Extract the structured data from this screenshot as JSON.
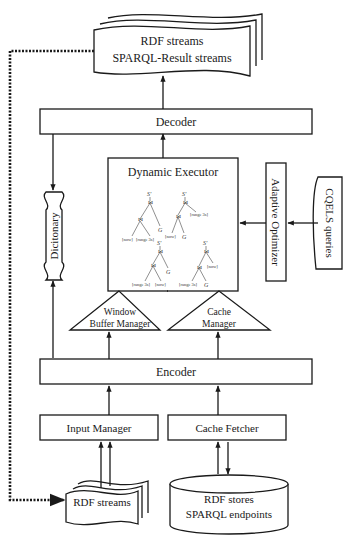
{
  "diagram": {
    "nodes": {
      "output_streams": {
        "line1": "RDF streams",
        "line2": "SPARQL-Result streams",
        "shape": "stacked-document"
      },
      "decoder": {
        "label": "Decoder",
        "shape": "rectangle"
      },
      "dictionary": {
        "label": "Dicitonary",
        "shape": "vertical-wavy-tape"
      },
      "dynamic_executor": {
        "label": "Dynamic Executor",
        "shape": "rectangle",
        "query_plans": [
          {
            "root": "S'",
            "join": "⋈",
            "leaves": [
              "[now]",
              "[range 3s]",
              "G"
            ]
          },
          {
            "root": "S'",
            "join": "⋈",
            "leaves": [
              "[now]",
              "G",
              "[range 3s]"
            ]
          },
          {
            "root": "S'",
            "join": "⋈",
            "leaves": [
              "[range 3s]",
              "[now]",
              "G"
            ]
          },
          {
            "root": "S'",
            "join": "⋈",
            "leaves": [
              "[range 3s]",
              "G",
              "[now]"
            ]
          }
        ]
      },
      "adaptive_optimizer": {
        "label": "Adaptive Optimizer",
        "shape": "vertical-rectangle"
      },
      "cqels_queries": {
        "label": "CQELS queries",
        "shape": "vertical-wavy-tape"
      },
      "window_buffer_manager": {
        "line1": "Window",
        "line2": "Buffer Manager",
        "shape": "triangle"
      },
      "cache_manager": {
        "line1": "Cache",
        "line2": "Manager",
        "shape": "triangle"
      },
      "encoder": {
        "label": "Encoder",
        "shape": "rectangle"
      },
      "input_manager": {
        "label": "Input Manager",
        "shape": "rectangle"
      },
      "cache_fetcher": {
        "label": "Cache Fetcher",
        "shape": "rectangle"
      },
      "input_streams": {
        "label": "RDF streams",
        "shape": "stacked-document"
      },
      "rdf_stores": {
        "line1": "RDF stores",
        "line2": "SPARQL endpoints",
        "shape": "cylinder"
      }
    },
    "edges": [
      {
        "from": "decoder",
        "to": "output_streams",
        "style": "solid-arrow"
      },
      {
        "from": "dynamic_executor",
        "to": "decoder",
        "style": "solid-arrow"
      },
      {
        "from": "decoder",
        "to": "dictionary",
        "style": "solid-arrow"
      },
      {
        "from": "encoder",
        "to": "dictionary",
        "style": "solid-arrow"
      },
      {
        "from": "cqels_queries",
        "to": "adaptive_optimizer",
        "style": "solid-arrow"
      },
      {
        "from": "adaptive_optimizer",
        "to": "dynamic_executor",
        "style": "solid-arrow"
      },
      {
        "from": "window_buffer_manager",
        "to": "dynamic_executor",
        "style": "line"
      },
      {
        "from": "cache_manager",
        "to": "dynamic_executor",
        "style": "line"
      },
      {
        "from": "encoder",
        "to": "window_buffer_manager",
        "style": "solid-arrow"
      },
      {
        "from": "encoder",
        "to": "cache_manager",
        "style": "solid-arrow"
      },
      {
        "from": "input_manager",
        "to": "encoder",
        "style": "solid-arrow"
      },
      {
        "from": "cache_fetcher",
        "to": "encoder",
        "style": "solid-arrow"
      },
      {
        "from": "input_streams",
        "to": "input_manager",
        "style": "double-solid-arrow"
      },
      {
        "from": "rdf_stores",
        "to": "cache_fetcher",
        "style": "solid-arrow"
      },
      {
        "from": "cache_fetcher",
        "to": "rdf_stores",
        "style": "solid-arrow"
      },
      {
        "from": "output_streams",
        "to": "input_streams",
        "style": "dotted-arrow"
      }
    ]
  }
}
